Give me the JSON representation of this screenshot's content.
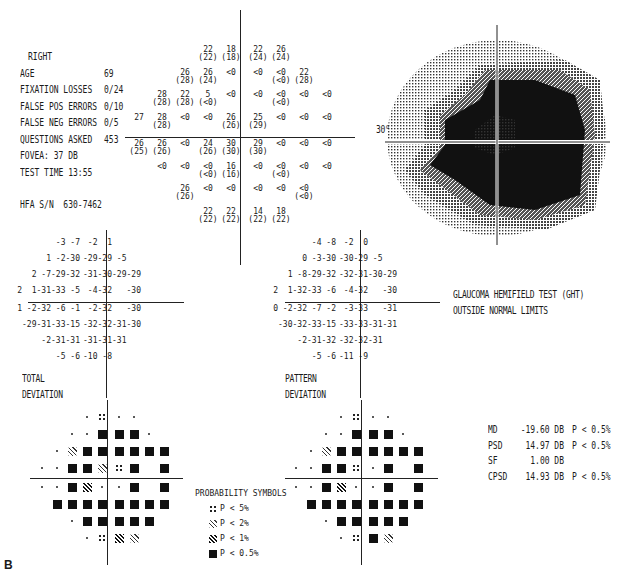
{
  "figure_label": "B",
  "patient_info": {
    "eye": "RIGHT",
    "rows": [
      {
        "label": "AGE",
        "value": "69"
      },
      {
        "label": "FIXATION LOSSES",
        "value": "0/24"
      },
      {
        "label": "FALSE POS ERRORS",
        "value": "0/10"
      },
      {
        "label": "FALSE NEG ERRORS",
        "value": "0/5"
      },
      {
        "label": "QUESTIONS ASKED",
        "value": "453"
      },
      {
        "label": "FOVEA:",
        "value": "37 DB"
      },
      {
        "label": "TEST TIME",
        "value": "13:55"
      }
    ],
    "serial": {
      "label": "HFA S/N",
      "value": "630-7462"
    }
  },
  "threshold_map": {
    "axis_label": "30°",
    "rows": [
      [
        null,
        null,
        null,
        "22|(22)",
        "18|(18)",
        "22|(24)",
        "26|(24)",
        null,
        null,
        null
      ],
      [
        null,
        null,
        "26|(28)",
        "26|(24)",
        "<0",
        "<0",
        "<0|(<0)",
        "22|(28)",
        null,
        null
      ],
      [
        null,
        "28|(28)",
        "22|(28)",
        "5|(<0)",
        "<0",
        "<0",
        "<0|(<0)",
        "<0",
        "<0",
        null
      ],
      [
        "27",
        "28|(28)",
        "<0",
        "<0",
        "26|(26)",
        "25|(29)",
        "<0",
        "<0",
        "<0",
        null
      ],
      [
        "26|(25)",
        "26|(26)",
        "<0",
        "24|(26)",
        "30|(30)",
        "29|(30)",
        "<0",
        "<0",
        "<0",
        null
      ],
      [
        null,
        "<0",
        "<0",
        "<0|(<0)",
        "16|(16)",
        "<0",
        "<0|(<0)",
        "<0",
        "<0",
        null
      ],
      [
        null,
        null,
        "26|(26)",
        "<0",
        "<0",
        "<0",
        "<0",
        "<0|(<0)",
        null,
        null
      ],
      [
        null,
        null,
        null,
        "22|(22)",
        "22|(22)",
        "14|(22)",
        "18|(22)",
        null,
        null,
        null
      ]
    ]
  },
  "total_deviation": {
    "title_line1": "TOTAL",
    "title_line2": "DEVIATION",
    "rows": [
      [
        null,
        null,
        null,
        "-3",
        "-7",
        "-2",
        "1",
        null,
        null,
        null
      ],
      [
        null,
        null,
        "1",
        "-2",
        "-30",
        "-29",
        "-29",
        "-5",
        null,
        null
      ],
      [
        null,
        "2",
        "-7",
        "-29",
        "-32",
        "-31",
        "-30",
        "-29",
        "-29",
        null
      ],
      [
        "2",
        "1",
        "-31",
        "-33",
        "-5",
        "-4",
        "-32",
        null,
        "-30",
        null
      ],
      [
        "1",
        "-2",
        "-32",
        "-6",
        "-1",
        "-2",
        "-32",
        null,
        "-30",
        null
      ],
      [
        null,
        "-29",
        "-31",
        "-33",
        "-15",
        "-32",
        "-32",
        "-31",
        "-30",
        null
      ],
      [
        null,
        null,
        "-2",
        "-31",
        "-31",
        "-31",
        "-31",
        "-31",
        null,
        null
      ],
      [
        null,
        null,
        null,
        "-5",
        "-6",
        "-10",
        "-8",
        null,
        null,
        null
      ]
    ]
  },
  "pattern_deviation": {
    "title_line1": "PATTERN",
    "title_line2": "DEVIATION",
    "rows": [
      [
        null,
        null,
        null,
        "-4",
        "-8",
        "-2",
        "0",
        null,
        null,
        null
      ],
      [
        null,
        null,
        "0",
        "-3",
        "-30",
        "-30",
        "-29",
        "-5",
        null,
        null
      ],
      [
        null,
        "1",
        "-8",
        "-29",
        "-32",
        "-32",
        "-31",
        "-30",
        "-29",
        null
      ],
      [
        "2",
        "1",
        "-32",
        "-33",
        "-6",
        "-4",
        "-32",
        null,
        "-30",
        null
      ],
      [
        "0",
        "-2",
        "-32",
        "-7",
        "-2",
        "-3",
        "-33",
        null,
        "-31",
        null
      ],
      [
        null,
        "-30",
        "-32",
        "-33",
        "-15",
        "-33",
        "-33",
        "-31",
        "-31",
        null
      ],
      [
        null,
        null,
        "-2",
        "-31",
        "-32",
        "-32",
        "-32",
        "-31",
        null,
        null
      ],
      [
        null,
        null,
        null,
        "-5",
        "-6",
        "-11",
        "-9",
        null,
        null,
        null
      ]
    ]
  },
  "total_deviation_probability": {
    "rows": [
      [
        null,
        null,
        null,
        "dot",
        "s5",
        "dot",
        "dot",
        null,
        null,
        null
      ],
      [
        null,
        null,
        "dot",
        "dot",
        "s05",
        "s05",
        "s05",
        "dot",
        null,
        null
      ],
      [
        null,
        "dot",
        "s2",
        "s05",
        "s05",
        "s05",
        "s05",
        "s05",
        "s05",
        null
      ],
      [
        "dot",
        "dot",
        "s05",
        "s05",
        "s2",
        "s5",
        "s05",
        null,
        "s05",
        null
      ],
      [
        "dot",
        "dot",
        "s05",
        "s1",
        "dot",
        "dot",
        "s05",
        null,
        "s05",
        null
      ],
      [
        null,
        "s05",
        "s05",
        "s05",
        "s05",
        "s05",
        "s05",
        "s05",
        "s05",
        null
      ],
      [
        null,
        null,
        "dot",
        "s05",
        "s05",
        "s05",
        "s05",
        "s05",
        null,
        null
      ],
      [
        null,
        null,
        null,
        "dot",
        "s5",
        "s1",
        "s2",
        null,
        null,
        null
      ]
    ]
  },
  "pattern_deviation_probability": {
    "rows": [
      [
        null,
        null,
        null,
        "dot",
        "s5",
        "dot",
        "dot",
        null,
        null,
        null
      ],
      [
        null,
        null,
        "dot",
        "dot",
        "s05",
        "s05",
        "s05",
        "dot",
        null,
        null
      ],
      [
        null,
        "dot",
        "s2",
        "s05",
        "s05",
        "s05",
        "s05",
        "s05",
        "s05",
        null
      ],
      [
        "dot",
        "dot",
        "s05",
        "s05",
        "s5",
        "dot",
        "s05",
        null,
        "s05",
        null
      ],
      [
        "dot",
        "dot",
        "s05",
        "s1",
        "dot",
        "dot",
        "s05",
        null,
        "s05",
        null
      ],
      [
        null,
        "s05",
        "s05",
        "s05",
        "s05",
        "s05",
        "s05",
        "s05",
        "s05",
        null
      ],
      [
        null,
        null,
        "dot",
        "s05",
        "s05",
        "s05",
        "s05",
        "s05",
        null,
        null
      ],
      [
        null,
        null,
        null,
        "dot",
        "s5",
        "s05",
        "s2",
        null,
        null,
        null
      ]
    ]
  },
  "ght": {
    "line1": "GLAUCOMA HEMIFIELD TEST (GHT)",
    "line2": "OUTSIDE NORMAL LIMITS"
  },
  "probability_legend": {
    "title": "PROBABILITY SYMBOLS",
    "items": [
      {
        "symbol": "s5",
        "label": "P <  5%"
      },
      {
        "symbol": "s2",
        "label": "P <  2%"
      },
      {
        "symbol": "s1",
        "label": "P <  1%"
      },
      {
        "symbol": "s05",
        "label": "P < 0.5%"
      }
    ]
  },
  "global_indices": [
    {
      "key": "MD",
      "value": "-19.60 DB",
      "p": "P < 0.5%"
    },
    {
      "key": "PSD",
      "value": "14.97 DB",
      "p": "P < 0.5%"
    },
    {
      "key": "SF",
      "value": "1.00 DB",
      "p": ""
    },
    {
      "key": "CPSD",
      "value": "14.93 DB",
      "p": "P < 0.5%"
    }
  ],
  "colors": {
    "ink": "#1a1a1a",
    "background": "#ffffff"
  }
}
